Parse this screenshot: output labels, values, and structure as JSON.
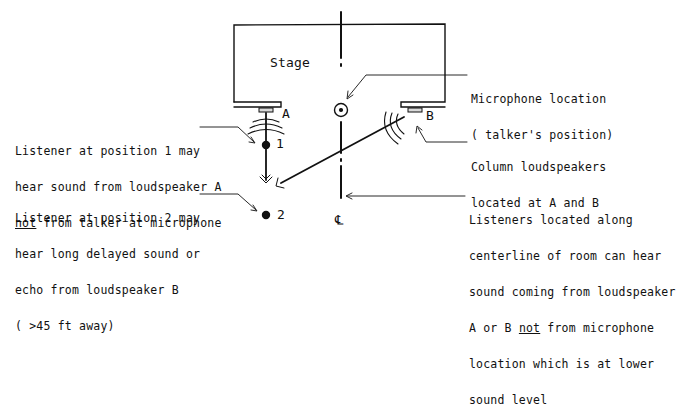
{
  "diagram": {
    "stage_label": "Stage",
    "speaker_a_label": "A",
    "speaker_b_label": "B",
    "position_1_label": "1",
    "position_2_label": "2",
    "centerline_symbol": "℄",
    "callouts": {
      "listener1": {
        "line1": "Listener at position 1 may",
        "line2": "hear sound from loudspeaker A",
        "line3_underlined": "not",
        "line3_rest": " from talker at microphone"
      },
      "listener2": {
        "line1": "Listener at position 2 may",
        "line2": "hear long delayed sound or",
        "line3": "echo from loudspeaker B",
        "line4": "( >45 ft away)"
      },
      "microphone": {
        "line1": "Microphone location",
        "line2": "( talker's position)"
      },
      "loudspeakers": {
        "line1": "Column loudspeakers",
        "line2": "located at A and B"
      },
      "centerline": {
        "line1": "Listeners located along",
        "line2": "centerline of room can hear",
        "line3": "sound coming from loudspeaker",
        "line4_start": "A or B ",
        "line4_underlined": "not",
        "line4_rest": " from microphone",
        "line5": "location which is at lower",
        "line6": "sound level"
      }
    },
    "colors": {
      "ink": "#111111",
      "speaker_fill": "#d9d9d9",
      "background": "#ffffff"
    }
  }
}
